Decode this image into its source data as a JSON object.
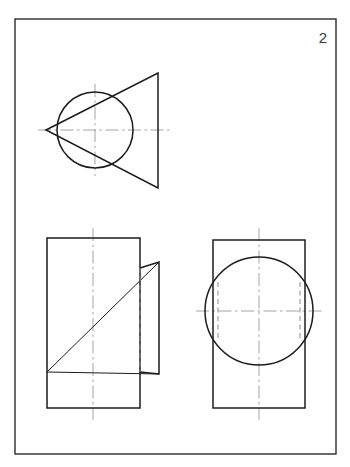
{
  "sheet": {
    "number_label": "2",
    "background_color": "#ffffff",
    "frame_color": "#2b2b2b",
    "object_line_color": "#1c1c1c",
    "hidden_line_color": "#8a8a8a",
    "center_line_color": "#9a9a9a",
    "width": 350,
    "height": 467
  },
  "frame": {
    "x": 15,
    "y": 19,
    "width": 321,
    "height": 435
  },
  "views": {
    "top_view": {
      "title": "circle-with-triangle-view",
      "circle": {
        "cx": 95,
        "cy": 130,
        "r": 38
      },
      "triangle_points": "46,130 158,73 158,188",
      "center_line_horizontal": {
        "x1": 38,
        "y1": 130,
        "x2": 170,
        "y2": 130
      },
      "center_line_vertical": {
        "x1": 95,
        "y1": 84,
        "x2": 95,
        "y2": 176
      }
    },
    "bottom_left_view": {
      "title": "rectangle-with-wedge-view",
      "rectangle": {
        "x": 47,
        "y": 238,
        "width": 93,
        "height": 170
      },
      "flap_points": "140,268 159,262 159,374 140,372",
      "diagonal_line": {
        "x1": 47,
        "y1": 372,
        "x2": 159,
        "y2": 262
      },
      "base_line": {
        "x1": 47,
        "y1": 372,
        "x2": 159,
        "y2": 374
      },
      "hidden_line_vertical": {
        "x1": 140,
        "y1": 268,
        "x2": 140,
        "y2": 372
      },
      "center_line_vertical": {
        "x1": 93,
        "y1": 228,
        "x2": 93,
        "y2": 420
      }
    },
    "bottom_right_view": {
      "title": "rectangle-with-circle-view",
      "rectangle": {
        "x": 213,
        "y": 240,
        "width": 92,
        "height": 168
      },
      "circle": {
        "cx": 259,
        "cy": 311,
        "r": 54
      },
      "hidden_line_left": {
        "x1": 218,
        "y1": 282,
        "x2": 218,
        "y2": 341
      },
      "hidden_line_right": {
        "x1": 300,
        "y1": 282,
        "x2": 300,
        "y2": 341
      },
      "center_line_horizontal": {
        "x1": 196,
        "y1": 311,
        "x2": 322,
        "y2": 311
      },
      "center_line_vertical": {
        "x1": 259,
        "y1": 228,
        "x2": 259,
        "y2": 420
      }
    }
  },
  "sheet_number_position": {
    "x": 323,
    "y": 43
  }
}
